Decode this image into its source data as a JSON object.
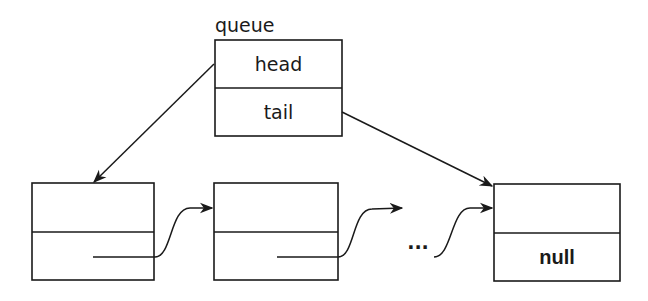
{
  "queue": {
    "label": "queue",
    "fields": [
      {
        "name": "head"
      },
      {
        "name": "tail"
      }
    ]
  },
  "nodes": [
    {
      "data": "",
      "next": ""
    },
    {
      "data": "",
      "next": ""
    },
    {
      "data": "",
      "next": "null"
    }
  ],
  "ellipsis": "...",
  "colors": {
    "stroke": "#1a1a1a",
    "background": "#ffffff"
  }
}
